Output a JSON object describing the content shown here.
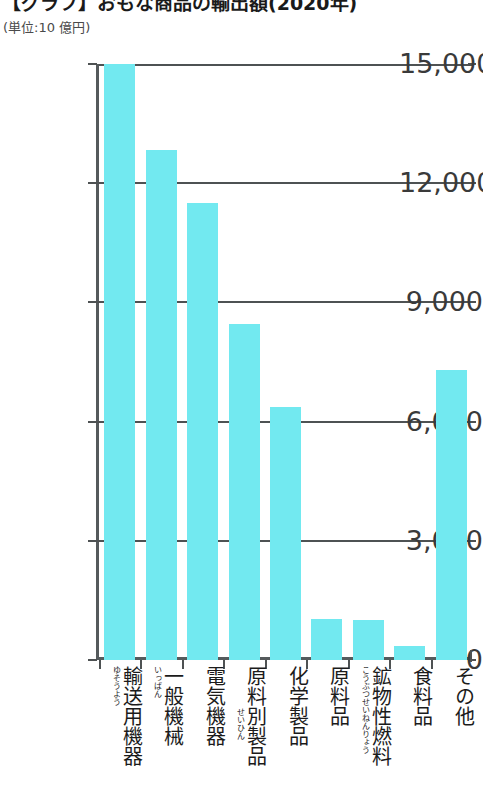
{
  "header": {
    "title": "【グラフ】おもな商品の輸出額(2020年)",
    "subtitle": "(単位:10 億円)"
  },
  "chart_data": {
    "type": "bar",
    "title": "【グラフ】おもな商品の輸出額(2020年)",
    "subtitle": "(単位:10 億円)",
    "xlabel": "",
    "ylabel": "",
    "unit": "10 億円",
    "ylim": [
      0,
      15000
    ],
    "yticks": [
      0,
      3000,
      6000,
      9000,
      12000,
      15000
    ],
    "ytick_labels": [
      "0",
      "3,000",
      "6,000",
      "9,000",
      "12,000",
      "15,000"
    ],
    "grid": "horizontal",
    "legend": "none",
    "bar_color": "#72e9f0",
    "axis_color": "#4e5253",
    "categories": [
      "輸送用機器",
      "一般機械",
      "電気機器",
      "原料別製品",
      "化学製品",
      "原料品",
      "鉱物性燃料",
      "食料品",
      "その他"
    ],
    "category_ruby": [
      "ゆそうよう",
      "いっぱん",
      "",
      "せいひん",
      "",
      "",
      "こうぶつせいねんりょう",
      "",
      ""
    ],
    "values": [
      15000,
      12830,
      11500,
      8450,
      6370,
      1030,
      1010,
      350,
      7300
    ]
  },
  "yaxis": {
    "ticks": [
      {
        "label": "15,000",
        "value": 15000
      },
      {
        "label": "12,000",
        "value": 12000
      },
      {
        "label": "9,000",
        "value": 9000
      },
      {
        "label": "6,000",
        "value": 6000
      },
      {
        "label": "3,000",
        "value": 3000
      },
      {
        "label": "0",
        "value": 0
      }
    ]
  },
  "xaxis": {
    "labels": [
      {
        "main": "輸送用機器",
        "ruby": "ゆそうよう"
      },
      {
        "main": "一般機械",
        "ruby": "いっぱん"
      },
      {
        "main": "電気機器",
        "ruby": ""
      },
      {
        "main": "原料別製品",
        "ruby": "せいひん"
      },
      {
        "main": "化学製品",
        "ruby": ""
      },
      {
        "main": "原料品",
        "ruby": ""
      },
      {
        "main": "鉱物性燃料",
        "ruby": "こうぶつせいねんりょう"
      },
      {
        "main": "食料品",
        "ruby": ""
      },
      {
        "main": "その他",
        "ruby": ""
      }
    ]
  }
}
